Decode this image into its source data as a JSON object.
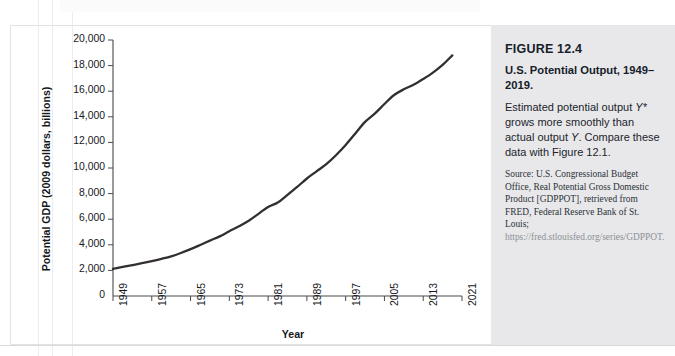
{
  "figure": {
    "number": "FIGURE 12.4",
    "title": "U.S. Potential Output, 1949–2019.",
    "description_part1": "Estimated potential output ",
    "description_italic1": "Y*",
    "description_part2": " grows more smoothly than actual output ",
    "description_italic2": "Y",
    "description_part3": ". Compare these data with Figure 12.1.",
    "source_text": "Source: U.S. Congressional Budget Office, Real Potential Gross Domestic Product [GDPPOT], retrieved from FRED, Federal Reserve Bank of St. Louis; ",
    "source_url": "https://fred.stlouisfed.org/series/GDPPOT.",
    "panel_background": "#e8e8ea"
  },
  "chart_data": {
    "type": "line",
    "title": "U.S. Potential Output, 1949–2019",
    "xlabel": "Year",
    "ylabel": "Potential GDP (2009 dollars, billions)",
    "xlim": [
      1949,
      2021
    ],
    "ylim": [
      0,
      20000
    ],
    "grid": false,
    "legend": "none",
    "line_color": "#332f30",
    "line_width_px": 2.3,
    "y_ticks": [
      0,
      2000,
      4000,
      6000,
      8000,
      10000,
      12000,
      14000,
      16000,
      18000,
      20000
    ],
    "y_tick_labels": [
      "0",
      "2,000",
      "4,000",
      "6,000",
      "8,000",
      "10,000",
      "12,000",
      "14,000",
      "16,000",
      "18,000",
      "20,000"
    ],
    "x_ticks": [
      1949,
      1957,
      1965,
      1973,
      1981,
      1989,
      1997,
      2005,
      2013,
      2021
    ],
    "x_tick_labels": [
      "1949",
      "1957",
      "1965",
      "1973",
      "1981",
      "1989",
      "1997",
      "2005",
      "2013",
      "2021"
    ],
    "series": [
      {
        "name": "Potential GDP (Y*)",
        "x": [
          1949,
          1951,
          1953,
          1955,
          1957,
          1959,
          1961,
          1963,
          1965,
          1967,
          1969,
          1971,
          1973,
          1975,
          1977,
          1979,
          1981,
          1983,
          1985,
          1987,
          1989,
          1991,
          1993,
          1995,
          1997,
          1999,
          2001,
          2003,
          2005,
          2007,
          2009,
          2011,
          2013,
          2015,
          2017,
          2019
        ],
        "values": [
          2120,
          2270,
          2420,
          2560,
          2720,
          2900,
          3100,
          3360,
          3660,
          3990,
          4330,
          4660,
          5060,
          5450,
          5880,
          6420,
          6960,
          7300,
          7900,
          8520,
          9180,
          9740,
          10300,
          11000,
          11800,
          12700,
          13600,
          14250,
          15000,
          15700,
          16150,
          16500,
          16950,
          17450,
          18050,
          18800
        ]
      }
    ]
  }
}
